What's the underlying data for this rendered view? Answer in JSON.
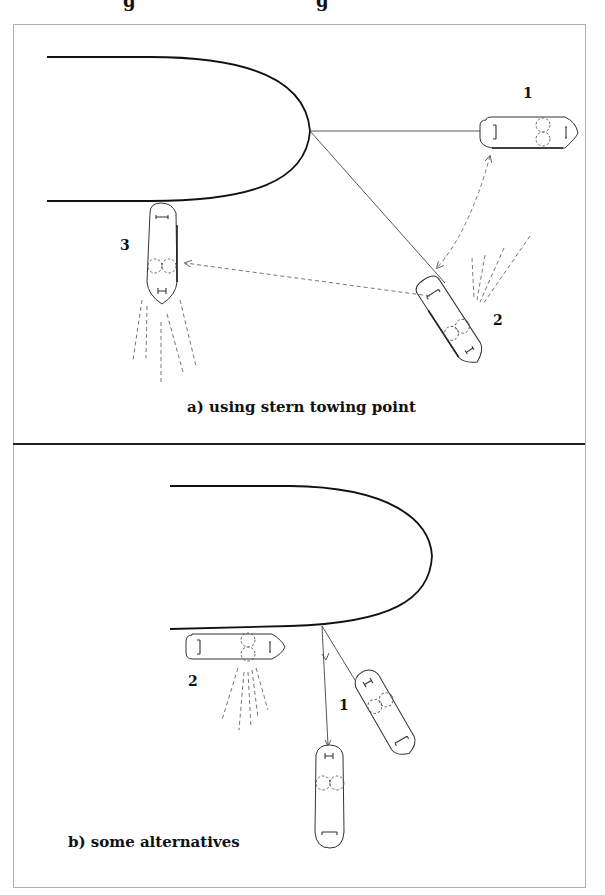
{
  "figure": {
    "title_fragment_left": "g",
    "title_fragment_right": "g",
    "panel_a": {
      "caption": "a) using stern towing point",
      "tug_labels": [
        "1",
        "2",
        "3"
      ]
    },
    "panel_b": {
      "caption": "b) some alternatives",
      "tug_labels": [
        "1",
        "2"
      ]
    },
    "colors": {
      "line": "#111111",
      "border": "#b0b0b0",
      "background": "#ffffff"
    }
  }
}
